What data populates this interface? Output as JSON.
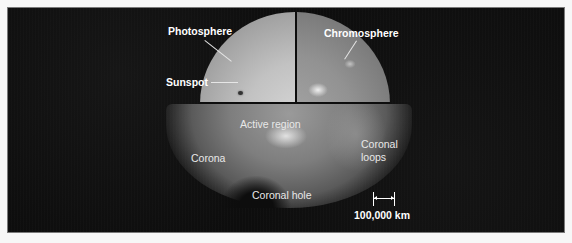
{
  "figure": {
    "labels": {
      "photosphere": "Photosphere",
      "chromosphere": "Chromosphere",
      "sunspot": "Sunspot",
      "active_region": "Active region",
      "corona": "Corona",
      "coronal_loops_line1": "Coronal",
      "coronal_loops_line2": "loops",
      "coronal_hole": "Coronal hole"
    },
    "scale": {
      "label": "100,000 km"
    }
  },
  "colors": {
    "background": "#0d0d0d",
    "frame": "#f7f7f7",
    "label_text": "#ffffff"
  }
}
